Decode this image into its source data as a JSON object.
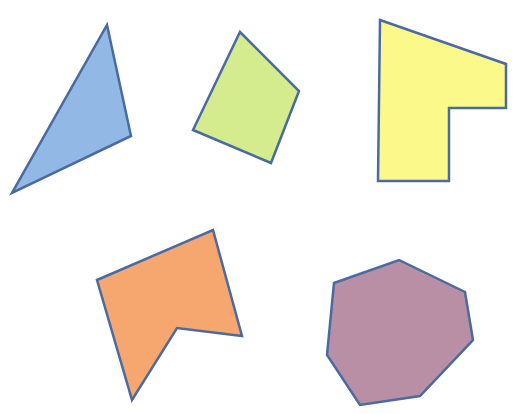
{
  "canvas": {
    "width": 514,
    "height": 414,
    "background": "#ffffff"
  },
  "stroke": {
    "color": "#4a6aa0",
    "width": 2.5
  },
  "shapes": [
    {
      "name": "blue-triangle",
      "sides": 3,
      "fill": "#92b8e6",
      "points": [
        [
          107,
          25
        ],
        [
          131,
          136
        ],
        [
          12,
          193
        ]
      ]
    },
    {
      "name": "green-quadrilateral",
      "sides": 4,
      "fill": "#d4eb8e",
      "points": [
        [
          240,
          32
        ],
        [
          299,
          91
        ],
        [
          271,
          163
        ],
        [
          193,
          130
        ]
      ]
    },
    {
      "name": "yellow-hexagon-l-shape",
      "sides": 6,
      "fill": "#fbf98a",
      "points": [
        [
          380,
          20
        ],
        [
          506,
          64
        ],
        [
          506,
          108
        ],
        [
          449,
          108
        ],
        [
          449,
          181
        ],
        [
          378,
          181
        ]
      ]
    },
    {
      "name": "orange-pentagon-concave",
      "sides": 5,
      "fill": "#f6a770",
      "points": [
        [
          97,
          280
        ],
        [
          213,
          230
        ],
        [
          242,
          336
        ],
        [
          177,
          328
        ],
        [
          132,
          400
        ]
      ]
    },
    {
      "name": "purple-heptagon",
      "sides": 7,
      "fill": "#b98fa6",
      "points": [
        [
          334,
          283
        ],
        [
          399,
          260
        ],
        [
          465,
          292
        ],
        [
          473,
          340
        ],
        [
          420,
          396
        ],
        [
          360,
          405
        ],
        [
          327,
          355
        ]
      ]
    }
  ]
}
